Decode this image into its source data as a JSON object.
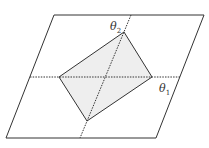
{
  "diagram": {
    "axes": [
      {
        "name": "theta_1",
        "label": "θ",
        "subscript": "1"
      },
      {
        "name": "theta_2",
        "label": "θ",
        "subscript": "2"
      }
    ],
    "colors": {
      "stroke": "#333333",
      "shade": "#eeeeee",
      "background": "#ffffff"
    }
  }
}
